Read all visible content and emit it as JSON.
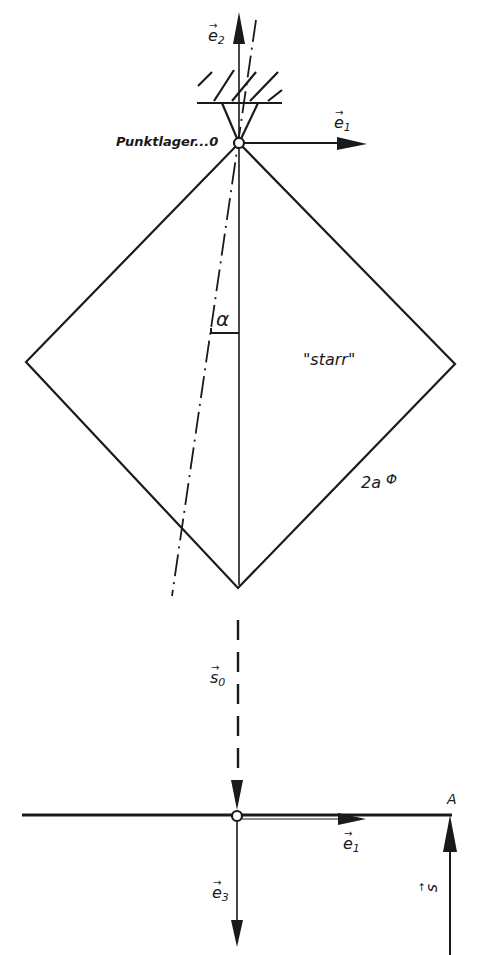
{
  "figure": {
    "type": "mechanics-diagram",
    "colors": {
      "ink": "#1a1a1a",
      "background": "#ffffff"
    },
    "labels": {
      "e2_top": {
        "base": "e",
        "sub": "2",
        "arrow": "→"
      },
      "e1_top": {
        "base": "e",
        "sub": "1",
        "arrow": "→"
      },
      "pivot": "Punktlager...0",
      "angle": "α",
      "rigid": "\"starr\"",
      "side": "2a",
      "side_symbol": "Φ",
      "s0": {
        "base": "s",
        "sub": "0",
        "arrow": "→"
      },
      "e1_bottom": {
        "base": "e",
        "sub": "1",
        "arrow": "→"
      },
      "e3": {
        "base": "e",
        "sub": "3",
        "arrow": "→"
      },
      "s": {
        "base": "s",
        "sub": "",
        "arrow": "→"
      },
      "point_a": "A"
    }
  }
}
